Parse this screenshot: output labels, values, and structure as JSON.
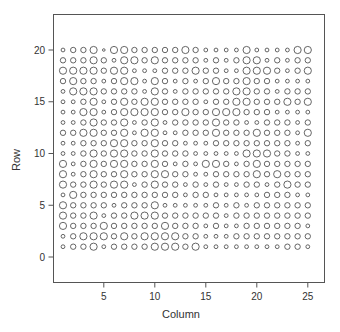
{
  "chart_data": {
    "type": "scatter",
    "title": "",
    "xlabel": "Column",
    "ylabel": "Row",
    "xlim": [
      -0.2,
      26.6
    ],
    "ylim": [
      -2.5,
      23.7
    ],
    "xticks": [
      5,
      10,
      15,
      20,
      25
    ],
    "yticks": [
      0,
      5,
      10,
      15,
      20
    ],
    "grid": false,
    "legend": null,
    "marker": "open circle, size encodes value (levels 1-5)",
    "columns": 25,
    "rows": 20,
    "size_levels_by_row_top_to_bottom": {
      "20": [
        2,
        3,
        3,
        4,
        1,
        4,
        4,
        3,
        3,
        3,
        3,
        3,
        4,
        3,
        2,
        2,
        2,
        2,
        4,
        2,
        2,
        2,
        2,
        4,
        4
      ],
      "19": [
        3,
        3,
        3,
        4,
        3,
        2,
        4,
        4,
        3,
        4,
        3,
        3,
        3,
        3,
        2,
        3,
        2,
        3,
        4,
        4,
        2,
        3,
        2,
        3,
        3
      ],
      "18": [
        4,
        4,
        4,
        4,
        3,
        4,
        4,
        2,
        2,
        2,
        3,
        3,
        3,
        4,
        3,
        3,
        2,
        2,
        4,
        4,
        4,
        3,
        2,
        3,
        4
      ],
      "17": [
        3,
        4,
        3,
        3,
        2,
        3,
        4,
        4,
        2,
        4,
        3,
        2,
        3,
        2,
        3,
        4,
        3,
        3,
        4,
        3,
        3,
        2,
        2,
        2,
        2
      ],
      "16": [
        2,
        4,
        4,
        4,
        3,
        3,
        3,
        3,
        2,
        4,
        3,
        2,
        3,
        3,
        3,
        3,
        3,
        4,
        4,
        3,
        3,
        2,
        3,
        3,
        3
      ],
      "15": [
        2,
        2,
        3,
        4,
        2,
        3,
        4,
        3,
        4,
        4,
        3,
        3,
        3,
        3,
        2,
        3,
        3,
        4,
        4,
        3,
        3,
        3,
        4,
        3,
        4
      ],
      "14": [
        2,
        2,
        4,
        4,
        2,
        3,
        4,
        4,
        4,
        4,
        3,
        3,
        4,
        3,
        3,
        4,
        4,
        4,
        3,
        3,
        3,
        2,
        2,
        2,
        2
      ],
      "13": [
        2,
        2,
        3,
        4,
        3,
        3,
        4,
        2,
        3,
        4,
        2,
        3,
        3,
        3,
        3,
        4,
        3,
        3,
        2,
        2,
        3,
        3,
        3,
        2,
        3
      ],
      "12": [
        3,
        3,
        4,
        4,
        3,
        3,
        4,
        2,
        4,
        4,
        2,
        2,
        3,
        3,
        3,
        4,
        3,
        3,
        3,
        4,
        3,
        3,
        3,
        2,
        4
      ],
      "11": [
        2,
        2,
        3,
        3,
        3,
        4,
        4,
        3,
        3,
        4,
        3,
        3,
        2,
        2,
        2,
        3,
        3,
        3,
        3,
        3,
        3,
        3,
        3,
        2,
        3
      ],
      "10": [
        2,
        2,
        3,
        4,
        3,
        4,
        4,
        3,
        3,
        4,
        3,
        3,
        3,
        2,
        2,
        2,
        2,
        2,
        4,
        4,
        4,
        3,
        3,
        2,
        2
      ],
      "9": [
        4,
        2,
        3,
        4,
        3,
        4,
        4,
        3,
        3,
        4,
        3,
        2,
        3,
        2,
        4,
        4,
        3,
        2,
        3,
        4,
        3,
        3,
        3,
        3,
        3
      ],
      "8": [
        4,
        2,
        3,
        4,
        3,
        3,
        4,
        3,
        3,
        4,
        4,
        3,
        3,
        2,
        2,
        3,
        3,
        3,
        3,
        4,
        3,
        4,
        3,
        3,
        3
      ],
      "7": [
        4,
        3,
        3,
        4,
        3,
        4,
        4,
        2,
        3,
        4,
        3,
        3,
        2,
        3,
        2,
        3,
        2,
        2,
        3,
        3,
        2,
        3,
        4,
        3,
        3
      ],
      "6": [
        2,
        4,
        3,
        3,
        3,
        3,
        3,
        3,
        3,
        3,
        3,
        3,
        2,
        3,
        3,
        2,
        2,
        2,
        2,
        2,
        3,
        3,
        3,
        2,
        2
      ],
      "5": [
        4,
        3,
        3,
        3,
        3,
        2,
        3,
        3,
        3,
        4,
        2,
        2,
        2,
        2,
        2,
        3,
        2,
        3,
        2,
        3,
        3,
        3,
        3,
        3,
        3
      ],
      "4": [
        4,
        3,
        3,
        4,
        2,
        3,
        3,
        4,
        4,
        4,
        3,
        3,
        3,
        3,
        3,
        3,
        2,
        3,
        3,
        3,
        3,
        3,
        3,
        3,
        3
      ],
      "3": [
        4,
        3,
        3,
        3,
        4,
        3,
        3,
        3,
        3,
        3,
        4,
        3,
        3,
        3,
        2,
        3,
        2,
        2,
        3,
        3,
        3,
        3,
        3,
        3,
        2
      ],
      "2": [
        2,
        3,
        4,
        4,
        4,
        3,
        4,
        3,
        4,
        4,
        4,
        4,
        3,
        3,
        2,
        2,
        2,
        3,
        3,
        3,
        3,
        3,
        3,
        3,
        3
      ],
      "1": [
        2,
        3,
        3,
        4,
        2,
        3,
        3,
        3,
        3,
        4,
        4,
        4,
        3,
        4,
        2,
        2,
        2,
        2,
        2,
        2,
        2,
        2,
        3,
        3,
        2
      ]
    }
  },
  "style": {
    "stroke": "#555555",
    "axis": "#444444",
    "background": "#ffffff"
  },
  "labels": {
    "xlabel": "Column",
    "ylabel": "Row",
    "xticks": [
      "5",
      "10",
      "15",
      "20",
      "25"
    ],
    "yticks": [
      "0",
      "5",
      "10",
      "15",
      "20"
    ]
  }
}
